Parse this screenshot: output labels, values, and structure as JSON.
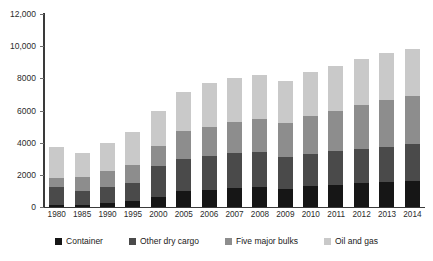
{
  "chart_data": {
    "type": "bar",
    "stacked": true,
    "title": "",
    "subtitle": "",
    "xlabel": "",
    "ylabel": "",
    "ylim": [
      0,
      12000
    ],
    "ytick_labels": [
      "12,000",
      "10,000",
      "8000",
      "6000",
      "4000",
      "2000",
      "0"
    ],
    "yticks": [
      12000,
      10000,
      8000,
      6000,
      4000,
      2000,
      0
    ],
    "grid": false,
    "legend_position": "bottom",
    "categories": [
      "1980",
      "1985",
      "1990",
      "1995",
      "2000",
      "2005",
      "2006",
      "2007",
      "2008",
      "2009",
      "2010",
      "2011",
      "2012",
      "2013",
      "2014"
    ],
    "series": [
      {
        "name": "Container",
        "color": "#161616",
        "values": [
          102,
          152,
          234,
          371,
          598,
          1001,
          1076,
          1193,
          1249,
          1127,
          1280,
          1393,
          1464,
          1544,
          1631
        ]
      },
      {
        "name": "Other dry cargo",
        "color": "#4a4a4a",
        "values": [
          1123,
          819,
          1031,
          1125,
          1928,
          2009,
          2112,
          2141,
          2173,
          2004,
          2027,
          2112,
          2150,
          2190,
          2280
        ]
      },
      {
        "name": "Five major bulks",
        "color": "#8d8d8d",
        "values": [
          608,
          900,
          988,
          1105,
          1295,
          1709,
          1814,
          1953,
          2065,
          2085,
          2335,
          2486,
          2742,
          2923,
          2985
        ]
      },
      {
        "name": "Oil and gas",
        "color": "#c9c9c9",
        "values": [
          1871,
          1459,
          1755,
          2050,
          2163,
          2422,
          2698,
          2747,
          2742,
          2642,
          2772,
          2794,
          2841,
          2904,
          2943
        ]
      }
    ],
    "totals": [
      3704,
      3330,
      4008,
      4651,
      5984,
      7141,
      7700,
      8034,
      8229,
      7858,
      8414,
      8785,
      9197,
      9561,
      9839
    ]
  },
  "legend": {
    "items": [
      {
        "label": "Container",
        "color": "#161616"
      },
      {
        "label": "Other dry cargo",
        "color": "#4a4a4a"
      },
      {
        "label": "Five major bulks",
        "color": "#8d8d8d"
      },
      {
        "label": "Oil and gas",
        "color": "#c9c9c9"
      }
    ]
  }
}
